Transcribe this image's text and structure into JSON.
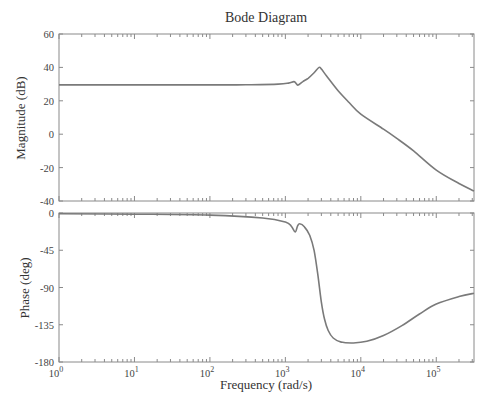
{
  "chart_data": {
    "type": "line",
    "title": "Bode Diagram",
    "xlabel": "Frequency (rad/s)",
    "xscale": "log",
    "xlim": [
      1,
      316228
    ],
    "x_tick_labels": [
      {
        "base": "10",
        "exp": "0",
        "value": 1
      },
      {
        "base": "10",
        "exp": "1",
        "value": 10
      },
      {
        "base": "10",
        "exp": "2",
        "value": 100
      },
      {
        "base": "10",
        "exp": "3",
        "value": 1000
      },
      {
        "base": "10",
        "exp": "4",
        "value": 10000
      },
      {
        "base": "10",
        "exp": "5",
        "value": 100000
      }
    ],
    "grid": false,
    "legend": null,
    "colors": {
      "line": "#7a7a7a",
      "axis": "#8a8a8a",
      "text": "#333333"
    },
    "panels": [
      {
        "name": "magnitude",
        "ylabel": "Magnitude (dB)",
        "ylim": [
          -40,
          60
        ],
        "yticks": [
          60,
          40,
          20,
          0,
          -20,
          -40
        ],
        "series": [
          {
            "name": "magnitude",
            "x": [
              1,
              10,
              100,
              300,
              800,
              1100,
              1300,
              1400,
              1480,
              1700,
              2000,
              2400,
              2800,
              3000,
              3500,
              5000,
              7000,
              10000,
              20000,
              30000,
              50000,
              100000,
              200000,
              316228
            ],
            "y": [
              29.5,
              29.5,
              29.5,
              29.6,
              30.0,
              30.6,
              31.5,
              30.2,
              29.4,
              31.5,
              33.5,
              36.8,
              40.0,
              39.0,
              35.0,
              26.0,
              19.0,
              12.0,
              3.0,
              -2.5,
              -10.0,
              -21.5,
              -29.5,
              -34.0
            ]
          }
        ]
      },
      {
        "name": "phase",
        "ylabel": "Phase (deg)",
        "ylim": [
          -180,
          0
        ],
        "yticks": [
          0,
          -45,
          -90,
          -135,
          -180
        ],
        "series": [
          {
            "name": "phase",
            "x": [
              1,
              10,
              100,
              500,
              1000,
              1200,
              1350,
              1450,
              1550,
              1800,
              2100,
              2400,
              2700,
              3000,
              3300,
              3700,
              4300,
              5500,
              8000,
              12000,
              20000,
              35000,
              60000,
              100000,
              200000,
              316228
            ],
            "y": [
              -1,
              -1.5,
              -2.5,
              -6,
              -11,
              -16,
              -23,
              -16,
              -13,
              -17,
              -27,
              -45,
              -75,
              -108,
              -128,
              -142,
              -151,
              -156,
              -157,
              -155,
              -148,
              -136,
              -122,
              -110,
              -101,
              -97
            ]
          }
        ]
      }
    ]
  }
}
